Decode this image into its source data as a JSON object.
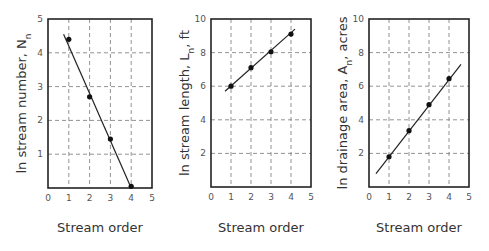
{
  "chart_data": [
    {
      "type": "scatter",
      "title": "",
      "xlabel": "Stream order",
      "ylabel": "ln stream number, N",
      "ylabel_subscript": "n",
      "ylabel_suffix": "",
      "xlim": [
        0,
        5
      ],
      "ylim": [
        0,
        5
      ],
      "xticks": [
        "0",
        "1",
        "2",
        "3",
        "4",
        "5"
      ],
      "yticks": [
        "1",
        "2",
        "3",
        "4",
        "5"
      ],
      "ytick_values": [
        1,
        2,
        3,
        4,
        5
      ],
      "grid": true,
      "legend": "none",
      "points": {
        "x": [
          1,
          2,
          3,
          4
        ],
        "y": [
          4.4,
          2.7,
          1.45,
          0.05
        ]
      },
      "fit_line": {
        "x": [
          0.75,
          4.0
        ],
        "y": [
          4.55,
          0.0
        ]
      },
      "frame_px": {
        "x0": 48,
        "x1": 152,
        "y0": 19,
        "y1": 188
      }
    },
    {
      "type": "scatter",
      "title": "",
      "xlabel": "Stream order",
      "ylabel": "ln stream length, L",
      "ylabel_subscript": "n",
      "ylabel_suffix": ", ft",
      "xlim": [
        0,
        5
      ],
      "ylim": [
        0,
        10
      ],
      "xticks": [
        "0",
        "1",
        "2",
        "3",
        "4",
        "5"
      ],
      "yticks": [
        "2",
        "4",
        "6",
        "8",
        "10"
      ],
      "ytick_values": [
        2,
        4,
        6,
        8,
        10
      ],
      "grid": true,
      "legend": "none",
      "points": {
        "x": [
          1,
          2,
          3,
          4
        ],
        "y": [
          6.0,
          7.1,
          8.05,
          9.1
        ]
      },
      "fit_line": {
        "x": [
          0.7,
          4.2
        ],
        "y": [
          5.7,
          9.4
        ]
      },
      "frame_px": {
        "x0": 211,
        "x1": 311,
        "y0": 19,
        "y1": 187
      }
    },
    {
      "type": "scatter",
      "title": "",
      "xlabel": "Stream order",
      "ylabel": "ln drainage area, A",
      "ylabel_subscript": "n",
      "ylabel_suffix": ", acres",
      "xlim": [
        0,
        5
      ],
      "ylim": [
        0,
        10
      ],
      "xticks": [
        "0",
        "1",
        "2",
        "3",
        "4",
        "5"
      ],
      "yticks": [
        "2",
        "4",
        "6",
        "8",
        "10"
      ],
      "ytick_values": [
        2,
        4,
        6,
        8,
        10
      ],
      "grid": true,
      "legend": "none",
      "points": {
        "x": [
          1,
          2,
          3,
          4
        ],
        "y": [
          1.8,
          3.35,
          4.9,
          6.45
        ]
      },
      "fit_line": {
        "x": [
          0.35,
          4.6
        ],
        "y": [
          0.8,
          7.3
        ]
      },
      "frame_px": {
        "x0": 369,
        "x1": 469,
        "y0": 19,
        "y1": 187
      }
    }
  ]
}
